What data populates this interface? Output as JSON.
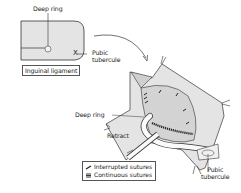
{
  "figure": {
    "inset": {
      "labels": {
        "deep_ring": "Deep ring",
        "pubic_tubercule": "Pubic tubercule",
        "pubic_tubercule_line1": "Pubic",
        "pubic_tubercule_line2": "tubercule",
        "inguinal_ligament": "Inguinal ligament",
        "marker": "X"
      }
    },
    "main": {
      "labels": {
        "deep_ring": "Deep ring",
        "retract": "Retract",
        "pubic_tubercule_line1": "Pubic",
        "pubic_tubercule_line2": "tubercule"
      }
    },
    "legend": {
      "items": [
        {
          "symbol": "interrupted-suture-icon",
          "label": "Interrupted sutures"
        },
        {
          "symbol": "continuous-suture-icon",
          "label": "Continuous sutures"
        }
      ]
    },
    "colors": {
      "fill_light": "#e4e4e4",
      "fill_mesh": "#d6d6d6",
      "stroke": "#333333",
      "suture": "#222222"
    }
  }
}
